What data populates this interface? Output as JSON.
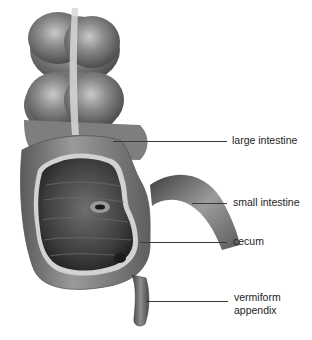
{
  "diagram": {
    "labels": {
      "large_intestine": "large intestine",
      "small_intestine": "small intestine",
      "cecum": "cecum",
      "appendix_line1": "vermiform",
      "appendix_line2": "appendix"
    },
    "colors": {
      "tissue_dark": "#4a4a4a",
      "tissue_mid": "#7a7a7a",
      "tissue_light": "#b5b5b5",
      "interior": "#3c3c3c",
      "leader_line": "#3a3a3a",
      "background": "#ffffff"
    }
  }
}
